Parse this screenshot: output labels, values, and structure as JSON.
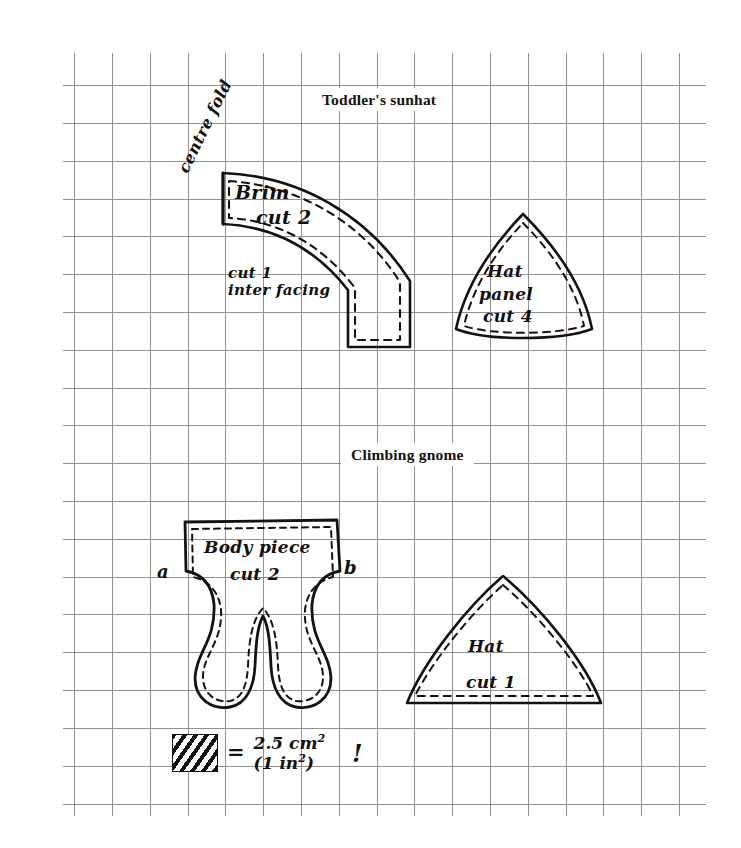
{
  "page": {
    "width": 741,
    "height": 848,
    "background": "#ffffff",
    "ink_color": "#16110e",
    "grid_color": "#8e8e8e"
  },
  "grid": {
    "origin_x": 74,
    "origin_y": 85,
    "spacing": 37.8,
    "cols": 17,
    "rows": 20,
    "left_bound": 63,
    "right_bound": 706,
    "top_bound": 53,
    "bottom_bound": 816
  },
  "sections": [
    {
      "id": "sunhat",
      "title": "Toddler's sunhat"
    },
    {
      "id": "gnome",
      "title": "Climbing gnome"
    }
  ],
  "pattern_pieces": [
    {
      "name": "brim",
      "section": "sunhat",
      "labels": [
        "Brim",
        "cut 2"
      ],
      "extra_labels": [
        "cut 1",
        "inter facing"
      ],
      "fold_label": "centre fold"
    },
    {
      "name": "hat-panel",
      "section": "sunhat",
      "labels": [
        "Hat",
        "panel",
        "cut 4"
      ]
    },
    {
      "name": "body-piece",
      "section": "gnome",
      "labels": [
        "Body piece",
        "cut 2"
      ],
      "markers": [
        "a",
        "b"
      ]
    },
    {
      "name": "gnome-hat",
      "section": "gnome",
      "labels": [
        "Hat",
        "cut 1"
      ]
    }
  ],
  "labels": {
    "centre_fold": "centre fold",
    "brim": "Brim",
    "brim_cut": "cut 2",
    "interfacing_line1": "cut 1",
    "interfacing_line2": "inter facing",
    "hat_panel_line1": "Hat",
    "hat_panel_line2": "panel",
    "hat_panel_line3": "cut 4",
    "body_line1": "Body piece",
    "body_line2": "cut 2",
    "marker_a": "a",
    "marker_b": "b",
    "gnome_hat_line1": "Hat",
    "gnome_hat_line2": "cut 1"
  },
  "legend": {
    "equals": "=",
    "value_metric": "2.5 cm",
    "value_metric_sup": "2",
    "value_imperial": "(1 in",
    "value_imperial_sup": "2",
    "value_imperial_close": ")",
    "exclamation": "!",
    "swatch": "hatched-square"
  }
}
